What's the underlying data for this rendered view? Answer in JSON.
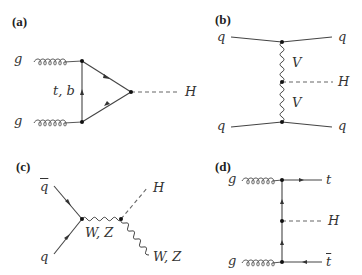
{
  "panels": {
    "a": {
      "label": "(a)",
      "gluon_top": "g",
      "gluon_bottom": "g",
      "loop": "t, b",
      "higgs": "H"
    },
    "b": {
      "label": "(b)",
      "quark_top_left": "q",
      "quark_top_right": "q",
      "quark_bottom_left": "q",
      "quark_bottom_right": "q",
      "boson_top": "V",
      "boson_bottom": "V",
      "higgs": "H"
    },
    "c": {
      "label": "(c)",
      "antiquark": "q",
      "quark": "q",
      "propagator": "W, Z",
      "higgs": "H",
      "boson_out": "W, Z"
    },
    "d": {
      "label": "(d)",
      "gluon_top": "g",
      "gluon_bottom": "g",
      "top": "t",
      "higgs": "H",
      "antitop": "t"
    }
  },
  "colors": {
    "line": "#444444",
    "vertex": "#111111",
    "background": "#ffffff"
  }
}
